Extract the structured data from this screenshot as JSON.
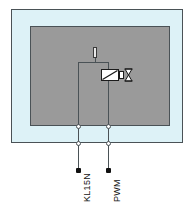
{
  "diagram": {
    "colors": {
      "enclosure_fill": "#ddf2f7",
      "module_fill": "#9a9a9a",
      "line": "#4a5256",
      "symbol_stroke": "#1b1b1b",
      "dot": "#111111",
      "background": "#ffffff"
    },
    "enclosure": {
      "name": "outer-housing",
      "label": ""
    },
    "module": {
      "name": "control-module",
      "label": ""
    },
    "components": {
      "valve": {
        "name": "valve-symbol",
        "label": ""
      },
      "bowtie": {
        "name": "bowtie-symbol",
        "label": ""
      },
      "indicator": {
        "name": "indicator-element",
        "label": ""
      }
    },
    "terminals": [
      {
        "id": "terminal-1",
        "label": "KL15N",
        "x": 78
      },
      {
        "id": "terminal-2",
        "label": "PWM",
        "x": 108
      }
    ]
  }
}
